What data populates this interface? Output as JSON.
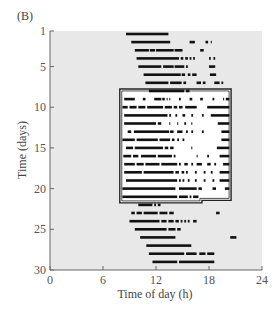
{
  "panel_label": "(B)",
  "colors": {
    "panel_bg": "#e8e8e8",
    "box_bg": "#ffffff",
    "bar": "#111111",
    "axis": "#666666"
  },
  "chart_data": {
    "type": "actogram",
    "title": "",
    "xlabel": "Time of day (h)",
    "ylabel": "Time (days)",
    "xlim": [
      0,
      24
    ],
    "ylim": [
      1,
      30
    ],
    "xticks": [
      0,
      6,
      12,
      18,
      24
    ],
    "yticks": [
      1,
      5,
      10,
      15,
      20,
      25,
      30
    ],
    "grid": false,
    "legend": null,
    "highlight_box": {
      "x_start": 7.9,
      "x_end": 20.5,
      "day_start": 8,
      "day_end": 22,
      "notch_x": 17.2,
      "notch_day": 21.2
    },
    "rows": [
      {
        "day": 1,
        "segments": [
          [
            8.6,
            13.4
          ]
        ]
      },
      {
        "day": 2,
        "segments": [
          [
            9.2,
            13.6
          ],
          [
            15.8,
            16.4
          ],
          [
            17.6,
            17.9
          ],
          [
            18.2,
            18.3
          ]
        ]
      },
      {
        "day": 3,
        "segments": [
          [
            9.6,
            11.2
          ],
          [
            11.3,
            11.9
          ],
          [
            12.0,
            14.0
          ],
          [
            14.1,
            15.0
          ],
          [
            17.0,
            17.4
          ]
        ]
      },
      {
        "day": 4,
        "segments": [
          [
            9.8,
            14.6
          ],
          [
            14.8,
            15.1
          ],
          [
            15.3,
            15.6
          ],
          [
            15.8,
            16.0
          ],
          [
            16.2,
            16.4
          ],
          [
            18.0,
            18.2
          ],
          [
            18.5,
            18.7
          ]
        ]
      },
      {
        "day": 5,
        "segments": [
          [
            10.0,
            12.6
          ],
          [
            12.8,
            14.0
          ],
          [
            14.1,
            15.2
          ],
          [
            15.4,
            15.6
          ],
          [
            18.0,
            18.7
          ]
        ]
      },
      {
        "day": 6,
        "segments": [
          [
            10.6,
            14.8
          ],
          [
            14.9,
            15.3
          ],
          [
            15.6,
            15.9
          ],
          [
            16.1,
            16.6
          ],
          [
            18.1,
            18.8
          ]
        ]
      },
      {
        "day": 7,
        "segments": [
          [
            10.8,
            13.4
          ],
          [
            13.6,
            14.9
          ],
          [
            15.1,
            15.4
          ],
          [
            16.6,
            17.1
          ],
          [
            17.3,
            17.6
          ],
          [
            18.6,
            19.2
          ],
          [
            19.4,
            19.6
          ]
        ]
      },
      {
        "day": 8,
        "segments": [
          [
            11.2,
            15.2
          ],
          [
            15.4,
            15.8
          ]
        ]
      },
      {
        "day": 9,
        "segments": [
          [
            8.4,
            9.6
          ],
          [
            10.5,
            10.8
          ],
          [
            11.8,
            12.6
          ],
          [
            12.7,
            13.0
          ],
          [
            13.2,
            13.3
          ],
          [
            13.5,
            13.6
          ],
          [
            14.6,
            14.8
          ],
          [
            15.8,
            16.1
          ],
          [
            17.0,
            17.3
          ],
          [
            18.4,
            18.6
          ],
          [
            19.6,
            19.7
          ],
          [
            19.9,
            20.3
          ]
        ]
      },
      {
        "day": 10,
        "segments": [
          [
            8.2,
            8.8
          ],
          [
            9.0,
            9.8
          ],
          [
            10.0,
            10.8
          ],
          [
            11.0,
            12.8
          ],
          [
            13.0,
            13.8
          ],
          [
            14.0,
            14.4
          ],
          [
            14.6,
            15.0
          ],
          [
            15.3,
            16.6
          ],
          [
            17.8,
            20.3
          ]
        ]
      },
      {
        "day": 11,
        "segments": [
          [
            8.4,
            13.3
          ],
          [
            13.5,
            13.7
          ],
          [
            14.2,
            14.4
          ],
          [
            15.0,
            15.3
          ],
          [
            16.0,
            16.2
          ],
          [
            17.2,
            17.4
          ],
          [
            18.2,
            20.3
          ]
        ]
      },
      {
        "day": 12,
        "segments": [
          [
            8.4,
            12.0
          ],
          [
            12.2,
            12.6
          ],
          [
            13.5,
            13.6
          ],
          [
            14.4,
            14.5
          ],
          [
            15.2,
            15.4
          ],
          [
            16.0,
            16.1
          ],
          [
            19.0,
            20.3
          ]
        ]
      },
      {
        "day": 13,
        "segments": [
          [
            8.8,
            9.2
          ],
          [
            9.5,
            13.5
          ],
          [
            13.6,
            14.0
          ],
          [
            14.4,
            15.0
          ],
          [
            15.4,
            15.6
          ],
          [
            16.0,
            16.2
          ],
          [
            17.2,
            17.4
          ],
          [
            19.4,
            20.3
          ]
        ]
      },
      {
        "day": 14,
        "segments": [
          [
            8.2,
            9.6
          ],
          [
            9.8,
            12.2
          ],
          [
            12.4,
            13.6
          ],
          [
            13.8,
            14.1
          ],
          [
            14.4,
            14.6
          ],
          [
            15.0,
            15.2
          ],
          [
            19.4,
            20.3
          ]
        ]
      },
      {
        "day": 15,
        "segments": [
          [
            8.6,
            9.4
          ],
          [
            9.6,
            12.8
          ],
          [
            13.0,
            13.4
          ],
          [
            13.6,
            14.0
          ],
          [
            16.0,
            16.1
          ],
          [
            18.9,
            20.3
          ]
        ]
      },
      {
        "day": 16,
        "segments": [
          [
            8.3,
            9.2
          ],
          [
            9.4,
            10.0
          ],
          [
            10.3,
            12.0
          ],
          [
            12.2,
            13.8
          ],
          [
            14.0,
            14.2
          ],
          [
            16.6,
            16.7
          ],
          [
            17.8,
            18.0
          ],
          [
            19.2,
            20.3
          ]
        ]
      },
      {
        "day": 17,
        "segments": [
          [
            8.4,
            9.6
          ],
          [
            9.8,
            10.6
          ],
          [
            10.8,
            12.4
          ],
          [
            12.6,
            14.4
          ],
          [
            14.6,
            14.8
          ],
          [
            15.2,
            15.6
          ],
          [
            16.0,
            16.2
          ],
          [
            16.6,
            17.2
          ],
          [
            17.8,
            18.2
          ],
          [
            18.6,
            18.8
          ],
          [
            19.6,
            20.3
          ]
        ]
      },
      {
        "day": 18,
        "segments": [
          [
            8.4,
            10.4
          ],
          [
            10.6,
            14.0
          ],
          [
            14.2,
            14.6
          ],
          [
            14.9,
            15.2
          ],
          [
            15.4,
            15.6
          ],
          [
            16.4,
            16.6
          ],
          [
            17.4,
            17.6
          ],
          [
            18.2,
            18.4
          ],
          [
            19.2,
            20.3
          ]
        ]
      },
      {
        "day": 19,
        "segments": [
          [
            8.6,
            14.4
          ],
          [
            14.6,
            14.8
          ],
          [
            15.0,
            15.2
          ],
          [
            15.6,
            15.8
          ],
          [
            16.4,
            16.6
          ],
          [
            17.4,
            17.6
          ],
          [
            18.4,
            18.6
          ],
          [
            19.2,
            20.3
          ]
        ]
      },
      {
        "day": 20,
        "segments": [
          [
            8.2,
            14.2
          ],
          [
            14.6,
            16.6
          ],
          [
            16.8,
            17.2
          ],
          [
            18.4,
            18.8
          ],
          [
            19.8,
            20.3
          ]
        ]
      },
      {
        "day": 21,
        "segments": [
          [
            8.2,
            14.4
          ],
          [
            14.6,
            15.6
          ],
          [
            15.8,
            16.0
          ],
          [
            16.2,
            16.8
          ]
        ]
      },
      {
        "day": 22,
        "segments": [
          [
            10.0,
            11.6
          ],
          [
            11.8,
            12.0
          ],
          [
            12.2,
            12.5
          ]
        ]
      },
      {
        "day": 23,
        "segments": [
          [
            9.2,
            9.6
          ],
          [
            9.8,
            10.4
          ],
          [
            10.6,
            12.2
          ],
          [
            12.4,
            13.3
          ],
          [
            13.5,
            14.0
          ],
          [
            18.8,
            19.2
          ]
        ]
      },
      {
        "day": 24,
        "segments": [
          [
            9.0,
            12.4
          ],
          [
            12.6,
            13.2
          ],
          [
            13.4,
            14.0
          ],
          [
            14.2,
            14.6
          ],
          [
            14.8,
            15.0
          ],
          [
            15.2,
            15.4
          ],
          [
            15.6,
            15.8
          ],
          [
            16.2,
            16.6
          ]
        ]
      },
      {
        "day": 25,
        "segments": [
          [
            9.6,
            13.2
          ],
          [
            13.4,
            14.2
          ],
          [
            14.4,
            14.8
          ]
        ]
      },
      {
        "day": 26,
        "segments": [
          [
            10.2,
            14.2
          ],
          [
            20.4,
            21.1
          ]
        ]
      },
      {
        "day": 27,
        "segments": [
          [
            10.9,
            16.0
          ]
        ]
      },
      {
        "day": 28,
        "segments": [
          [
            11.2,
            15.2
          ],
          [
            15.4,
            16.6
          ],
          [
            16.9,
            17.6
          ],
          [
            17.8,
            18.6
          ]
        ]
      },
      {
        "day": 29,
        "segments": [
          [
            11.6,
            14.4
          ],
          [
            14.6,
            18.6
          ]
        ]
      }
    ]
  }
}
